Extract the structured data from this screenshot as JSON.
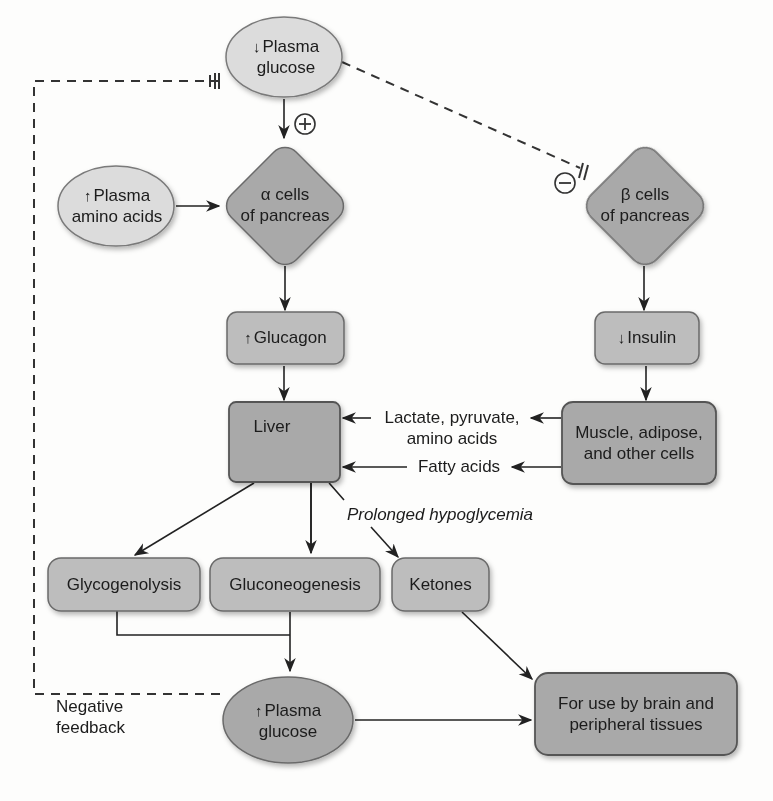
{
  "colors": {
    "background": "#fdfdfc",
    "light_node_fill": "#dcdcdc",
    "dark_node_fill": "#a9a9a9",
    "box_fill": "#bdbdbd",
    "stroke": "#555555",
    "line": "#222222"
  },
  "nodes": {
    "plasma_glucose_low": {
      "arrow": "↓",
      "line1": "Plasma",
      "line2": "glucose"
    },
    "plasma_amino_acids": {
      "arrow": "↑",
      "line1": "Plasma",
      "line2": "amino acids"
    },
    "alpha_cells": {
      "line1": "α cells",
      "line2": "of pancreas"
    },
    "beta_cells": {
      "line1": "β cells",
      "line2": "of pancreas"
    },
    "glucagon": {
      "arrow": "↑",
      "label": "Glucagon"
    },
    "insulin": {
      "arrow": "↓",
      "label": "Insulin"
    },
    "liver": {
      "label": "Liver"
    },
    "muscle": {
      "line1": "Muscle, adipose,",
      "line2": "and other cells"
    },
    "glycogenolysis": {
      "label": "Glycogenolysis"
    },
    "gluconeogenesis": {
      "label": "Gluconeogenesis"
    },
    "ketones": {
      "label": "Ketones"
    },
    "plasma_glucose_high": {
      "arrow": "↑",
      "line1": "Plasma",
      "line2": "glucose"
    },
    "brain_use": {
      "line1": "For use by brain and",
      "line2": "peripheral tissues"
    }
  },
  "edge_labels": {
    "lactate": {
      "line1": "Lactate, pyruvate,",
      "line2": "amino acids"
    },
    "fatty_acids": "Fatty acids",
    "prolonged": "Prolonged hypoglycemia",
    "negative_feedback": {
      "line1": "Negative",
      "line2": "feedback"
    },
    "plus_sign": "+",
    "minus_sign": "−"
  }
}
